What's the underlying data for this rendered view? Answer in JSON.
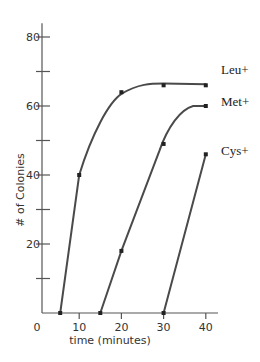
{
  "chart_data": {
    "type": "line",
    "title": "",
    "xlabel": "time (minutes)",
    "ylabel": "# of Colonies",
    "xlim": [
      0,
      40
    ],
    "ylim": [
      0,
      80
    ],
    "x_ticks": [
      0,
      10,
      20,
      30,
      40
    ],
    "x_tick_labels": [
      "0",
      "10",
      "20",
      "30",
      "40"
    ],
    "y_ticks": [
      0,
      10,
      20,
      30,
      40,
      50,
      60,
      70,
      80
    ],
    "y_tick_labels": [
      "",
      "",
      "20",
      "",
      "40",
      "",
      "60",
      "",
      "80"
    ],
    "grid": false,
    "legend_position": "right, inline labels at curve ends",
    "series": [
      {
        "name": "Leu+",
        "x": [
          5.5,
          10,
          20,
          30,
          40
        ],
        "y": [
          0,
          40,
          64,
          66,
          66
        ]
      },
      {
        "name": "Met+",
        "x": [
          15,
          20,
          30,
          40
        ],
        "y": [
          0,
          18,
          49,
          60
        ]
      },
      {
        "name": "Cys+",
        "x": [
          30,
          40
        ],
        "y": [
          0,
          46
        ]
      }
    ]
  }
}
